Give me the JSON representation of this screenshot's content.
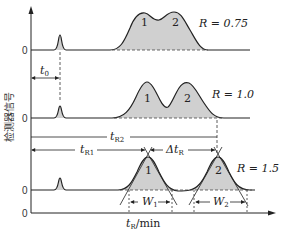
{
  "figure": {
    "y_axis_label": "检测器信号",
    "x_axis_label": "t",
    "x_axis_label_sub": "R",
    "x_axis_label_unit": "/min",
    "zero_label": "0",
    "panels": [
      {
        "resolution_label": "R = 0.75",
        "peak1_label": "1",
        "peak2_label": "2"
      },
      {
        "resolution_label": "R = 1.0",
        "peak1_label": "1",
        "peak2_label": "2"
      },
      {
        "resolution_label": "R = 1.5",
        "peak1_label": "1",
        "peak2_label": "2"
      }
    ],
    "annotations": {
      "t0": "t",
      "t0_sub": "0",
      "tR1": "t",
      "tR1_sub": "R1",
      "tR2": "t",
      "tR2_sub": "R2",
      "delta_tR": "Δt",
      "delta_tR_sub": "R",
      "W1": "W",
      "W1_sub": "1",
      "W2": "W",
      "W2_sub": "2"
    },
    "colors": {
      "line": "#222222",
      "fill": "#d0d0d0",
      "dash": "#333333"
    }
  }
}
